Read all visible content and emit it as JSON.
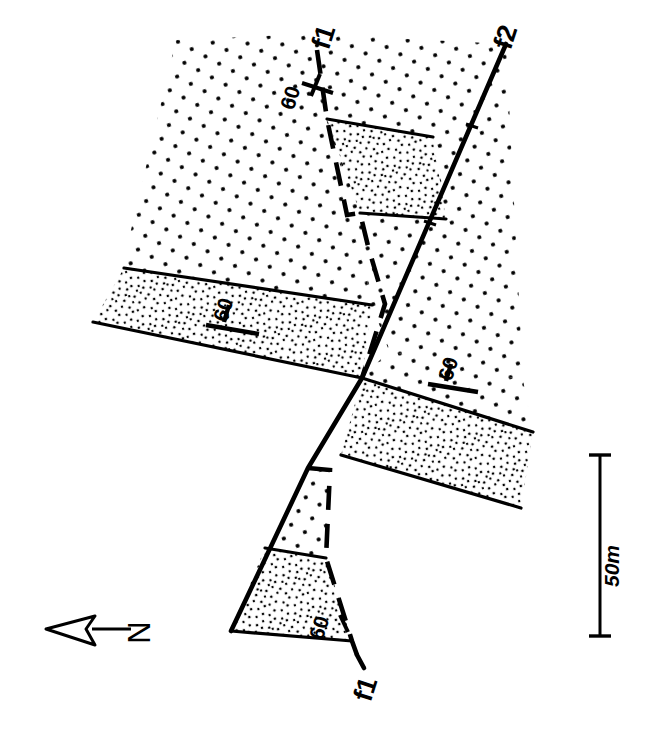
{
  "figure": {
    "type": "geological-map",
    "background_color": "#ffffff",
    "line_color": "#000000"
  },
  "faults": [
    {
      "id": "f1-upper",
      "label": "f1",
      "style": "dashed",
      "label_x": 332,
      "label_y": 40,
      "label_rotation": -72
    },
    {
      "id": "f2",
      "label": "f2",
      "style": "solid",
      "label_x": 512,
      "label_y": 42,
      "label_rotation": -72
    },
    {
      "id": "f1-lower",
      "label": "f1",
      "style": "dashed",
      "label_x": 372,
      "label_y": 690,
      "label_rotation": -72
    }
  ],
  "dip_symbols": [
    {
      "id": "dip-upper-fault",
      "value": "60",
      "label_x": 297,
      "label_y": 100,
      "label_rotation": -72
    },
    {
      "id": "dip-left-bed",
      "value": "60",
      "label_x": 230,
      "label_y": 315,
      "label_rotation": -72
    },
    {
      "id": "dip-right-bed",
      "value": "60",
      "label_x": 456,
      "label_y": 372,
      "label_rotation": -72
    },
    {
      "id": "dip-lower-bed",
      "value": "60",
      "label_x": 327,
      "label_y": 628,
      "label_rotation": -72
    }
  ],
  "scale_bar": {
    "label": "50m",
    "x": 600,
    "top_y": 455,
    "bottom_y": 636,
    "label_x": 616,
    "label_y": 566,
    "label_rotation": -90
  },
  "north_arrow": {
    "label": "N",
    "direction": "left",
    "label_x": 148,
    "label_y": 635,
    "label_rotation": -90,
    "arrow_tip_x": 48,
    "arrow_tail_x": 130,
    "arrow_y": 629
  },
  "units": [
    {
      "id": "country-rock",
      "pattern": "sparse-stipple",
      "description": "Regularly spaced sparse dots"
    },
    {
      "id": "marker-bed",
      "pattern": "dense-stipple",
      "description": "Dense irregular fine dots"
    },
    {
      "id": "unfilled-wedge",
      "pattern": "blank",
      "description": "White unpatterned fault wedge"
    }
  ]
}
